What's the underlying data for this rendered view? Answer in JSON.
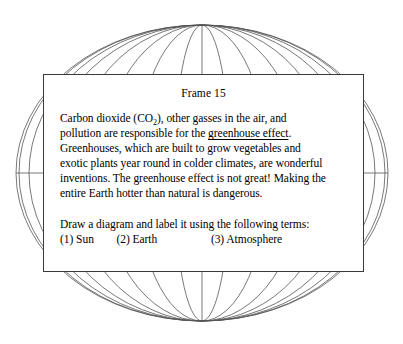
{
  "graphic": {
    "name": "wireframe-globe",
    "description": "Wireframe sphere with meridians and equator",
    "line_color": "#555555",
    "background_color": "#ffffff",
    "center_x": 202,
    "center_y": 173,
    "radius_x": 186,
    "radius_y": 148,
    "meridian_count": 12,
    "has_equator": true
  },
  "frame": {
    "title": "Frame 15",
    "border_color": "#3a3a3a",
    "background_color": "#ffffff",
    "paragraph": {
      "line1_a": "Carbon dioxide (CO",
      "line1_sub": "2",
      "line1_b": "), other gasses in the air, and",
      "line2_a": "pollution are responsible for the ",
      "line2_underlined": "greenhouse effect",
      "line2_b": ".",
      "line3": "Greenhouses, which are built to grow vegetables and",
      "line4": "exotic plants year round in colder climates, are wonderful",
      "line5": "inventions. The greenhouse effect is not great! Making the",
      "line6": "entire Earth hotter than natural is dangerous."
    },
    "instruction": "Draw a diagram and label it using the following terms:",
    "terms": {
      "term1": "(1) Sun",
      "term2": "(2) Earth",
      "term3": "(3) Atmosphere",
      "gap1": "        ",
      "gap2": "                   "
    }
  }
}
